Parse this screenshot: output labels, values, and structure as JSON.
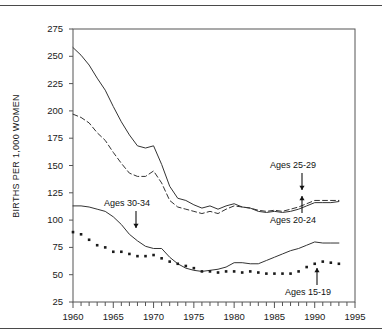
{
  "figure": {
    "ylabel": "BIRTHS PER 1,000 WOMEN",
    "rule_color": "#4a4a4a"
  },
  "axes": {
    "y_ticks": [
      "275",
      "250",
      "225",
      "200",
      "175",
      "150",
      "125",
      "100",
      "75",
      "50",
      "25"
    ],
    "x_ticks": [
      "1960",
      "1965",
      "1970",
      "1975",
      "1980",
      "1985",
      "1990",
      "1995"
    ]
  },
  "annotations": [
    {
      "id": "ages-25-29",
      "label": "Ages 25-29"
    },
    {
      "id": "ages-20-24",
      "label": "Ages 20-24"
    },
    {
      "id": "ages-30-34",
      "label": "Ages 30-34"
    },
    {
      "id": "ages-15-19",
      "label": "Ages 15-19"
    }
  ],
  "chart_data": {
    "type": "line",
    "title": "",
    "xlabel": "",
    "ylabel": "BIRTHS PER 1,000 WOMEN",
    "xlim": [
      1960,
      1995
    ],
    "ylim": [
      25,
      275
    ],
    "y_tick_values": [
      25,
      50,
      75,
      100,
      125,
      150,
      175,
      200,
      225,
      250,
      275
    ],
    "x_tick_values": [
      1960,
      1965,
      1970,
      1975,
      1980,
      1985,
      1990,
      1995
    ],
    "x_minor_tick_step": 1,
    "grid": false,
    "legend": "annotated-inline",
    "x": [
      1960,
      1961,
      1962,
      1963,
      1964,
      1965,
      1966,
      1967,
      1968,
      1969,
      1970,
      1971,
      1972,
      1973,
      1974,
      1975,
      1976,
      1977,
      1978,
      1979,
      1980,
      1981,
      1982,
      1983,
      1984,
      1985,
      1986,
      1987,
      1988,
      1989,
      1990,
      1991,
      1992,
      1993
    ],
    "series": [
      {
        "name": "Ages 20-24",
        "style": "solid",
        "color": "#333333",
        "values": [
          258,
          251,
          242,
          230,
          219,
          204,
          190,
          178,
          168,
          166,
          168,
          151,
          131,
          120,
          118,
          114,
          111,
          113,
          110,
          113,
          115,
          112,
          111,
          108,
          107,
          108,
          107,
          108,
          110,
          113,
          116,
          116,
          116,
          117
        ]
      },
      {
        "name": "Ages 25-29",
        "style": "dashed",
        "color": "#333333",
        "values": [
          197,
          194,
          189,
          180,
          173,
          162,
          152,
          143,
          140,
          140,
          145,
          134,
          118,
          112,
          110,
          108,
          106,
          108,
          106,
          110,
          113,
          112,
          111,
          109,
          108,
          109,
          108,
          110,
          112,
          115,
          118,
          118,
          118,
          118
        ]
      },
      {
        "name": "Ages 30-34",
        "style": "solid",
        "color": "#333333",
        "values": [
          113,
          113,
          112,
          110,
          108,
          103,
          96,
          87,
          81,
          76,
          74,
          74,
          66,
          60,
          56,
          54,
          53,
          54,
          55,
          57,
          61,
          61,
          60,
          60,
          63,
          66,
          69,
          72,
          74,
          77,
          80,
          79,
          79,
          79
        ]
      },
      {
        "name": "Ages 15-19",
        "style": "dotted",
        "color": "#1a1a1a",
        "values": [
          89,
          87,
          82,
          77,
          75,
          71,
          71,
          69,
          67,
          67,
          68,
          65,
          62,
          60,
          58,
          56,
          53,
          53,
          52,
          53,
          53,
          52,
          53,
          52,
          51,
          51,
          51,
          51,
          53,
          57,
          60,
          62,
          61,
          60
        ]
      }
    ]
  }
}
